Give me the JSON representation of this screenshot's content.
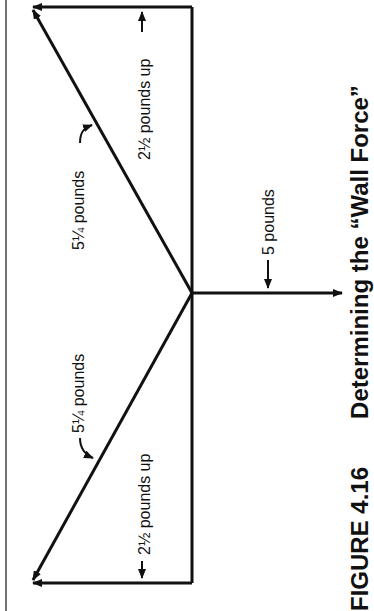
{
  "figure": {
    "caption_number": "FIGURE 4.16",
    "caption_title": "Determining the “Wall Force”",
    "orientation": "rotated 90 degrees counter-clockwise",
    "labels": {
      "top_vertical": "2½ pounds up",
      "top_diagonal": "5¼ pounds",
      "center_load": "5 pounds",
      "bottom_diagonal": "5¼ pounds",
      "bottom_vertical": "2½ pounds up"
    }
  },
  "colors": {
    "ink": "#111111",
    "background": "#ffffff",
    "frame": "#444444"
  }
}
